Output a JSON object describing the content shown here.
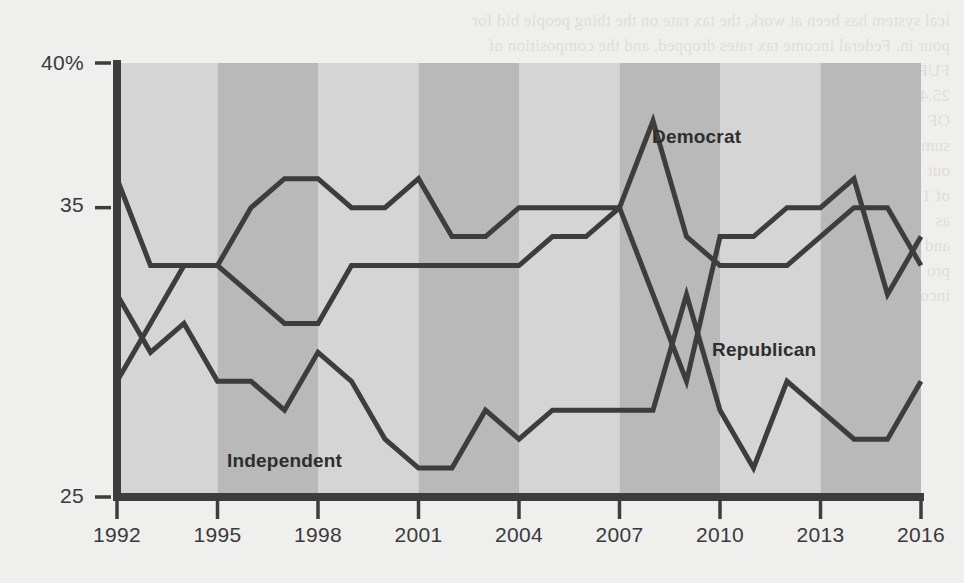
{
  "chart_data": {
    "type": "line",
    "title": "",
    "subtitle": "",
    "xlabel": "",
    "ylabel": "",
    "xlim": [
      1992,
      2016
    ],
    "ylim": [
      25,
      40
    ],
    "grid": false,
    "legend_position": "inline-annotations",
    "y_ticks": [
      "40%",
      "35",
      "25"
    ],
    "y_tick_values": [
      40,
      35,
      25
    ],
    "x_ticks": [
      "1992",
      "1995",
      "1998",
      "2001",
      "2004",
      "2007",
      "2010",
      "2013",
      "2016"
    ],
    "x_tick_values": [
      1992,
      1995,
      1998,
      2001,
      2004,
      2007,
      2010,
      2013,
      2016
    ],
    "x": [
      1992,
      1993,
      1994,
      1995,
      1996,
      1997,
      1998,
      1999,
      2000,
      2001,
      2002,
      2003,
      2004,
      2005,
      2006,
      2007,
      2008,
      2009,
      2010,
      2011,
      2012,
      2013,
      2014,
      2015,
      2016
    ],
    "series": [
      {
        "name": "Democrat",
        "color": "#3d3d3d",
        "values": [
          36,
          33,
          33,
          33,
          32,
          31,
          31,
          33,
          33,
          33,
          33,
          33,
          33,
          34,
          34,
          35,
          38,
          34,
          33,
          33,
          33,
          34,
          35,
          35,
          33
        ]
      },
      {
        "name": "Republican",
        "color": "#3d3d3d",
        "values": [
          29,
          31,
          33,
          33,
          35,
          36,
          36,
          35,
          35,
          36,
          34,
          34,
          35,
          35,
          35,
          35,
          32,
          29,
          34,
          34,
          35,
          35,
          36,
          32,
          34
        ]
      },
      {
        "name": "Independent",
        "color": "#3d3d3d",
        "values": [
          32,
          30,
          31,
          29,
          29,
          28,
          30,
          29,
          27,
          26,
          26,
          28,
          27,
          28,
          28,
          28,
          28,
          32,
          28,
          26,
          29,
          28,
          27,
          27,
          29
        ]
      }
    ],
    "annotations": [
      {
        "text": "Democrat",
        "x": 2008.6,
        "y": 37.1
      },
      {
        "text": "Republican",
        "x": 2010.1,
        "y": 30.6
      },
      {
        "text": "Independent",
        "x": 1995.6,
        "y": 25.9
      }
    ],
    "band_colors": {
      "light": "#d5d5d5",
      "dark": "#b9b9b9"
    },
    "background": "#efefed",
    "axis_color": "#3d3d3d",
    "line_color": "#3d3d3d",
    "line_width_px": 5
  },
  "bleed_text": [
    "ical system has been at work, the tax rate on the thing people bid for",
    "pour in. Federal income tax rates dropped, and the composition of",
    "FUR",
    "25.4",
    "OF",
    "sum",
    "out",
    "of 1",
    "as",
    "and",
    "pro",
    "income and payroll taxes has shifted toward the upper brackets."
  ]
}
